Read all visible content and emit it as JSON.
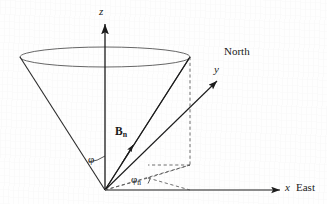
{
  "figure": {
    "background_color": "#fefefe",
    "stroke_color": "#1a1a1a",
    "cone_stroke_color": "#4a4a4a",
    "dashed_color": "#555555",
    "width": 327,
    "height": 204
  },
  "axes": {
    "origin": {
      "x": 105,
      "y": 190
    },
    "z": {
      "label": "z",
      "label_x": 99,
      "label_y": 6,
      "tip": {
        "x": 105,
        "y": 22
      }
    },
    "x": {
      "label": "x",
      "annotation": "East",
      "label_x": 285,
      "label_y": 182,
      "tip": {
        "x": 282,
        "y": 190
      }
    },
    "y": {
      "label": "y",
      "annotation": "North",
      "label_x": 214,
      "label_y": 64,
      "tip": {
        "x": 218,
        "y": 80
      }
    }
  },
  "vector": {
    "symbol": "B",
    "subscript": "n",
    "label": "Bn",
    "label_x": 115,
    "label_y": 126,
    "tail": {
      "x": 105,
      "y": 190
    },
    "head": {
      "x": 190,
      "y": 57
    },
    "arrow_marker_at": {
      "x": 134,
      "y": 142
    }
  },
  "angles": {
    "polar": {
      "symbol": "φ",
      "label": "φ",
      "description": "cone half-angle from z-axis to cone surface",
      "label_x": 88,
      "label_y": 154
    },
    "azimuth": {
      "symbol": "φ",
      "subscript": "n",
      "label": "φn",
      "description": "azimuth angle in the horizontal plane measured from the x (East) axis",
      "label_x": 131,
      "label_y": 174
    }
  },
  "cone": {
    "apex": {
      "x": 105,
      "y": 190
    },
    "rim_center": {
      "x": 105,
      "y": 57
    },
    "rim_rx": 85,
    "rim_ry": 10,
    "left_edge_point": {
      "x": 20,
      "y": 57
    },
    "right_edge_point": {
      "x": 190,
      "y": 57
    }
  },
  "projection_lines": {
    "style": "dashed",
    "vertical_drop": {
      "x1": 190,
      "y1": 57,
      "x2": 190,
      "y2": 165
    },
    "ground_point": {
      "x": 190,
      "y": 165
    },
    "foot_point": {
      "x": 148,
      "y": 178
    }
  }
}
